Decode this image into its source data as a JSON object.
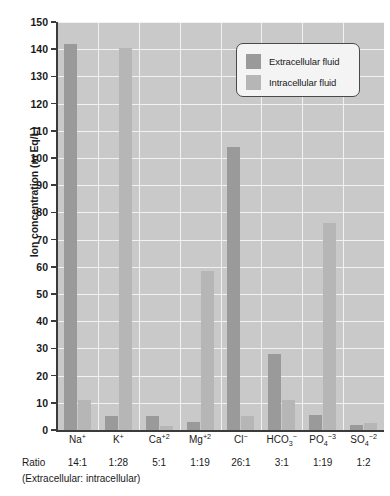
{
  "chart_data": {
    "type": "bar",
    "title": "",
    "subtitle": "",
    "xlabel": "",
    "ylabel": "Ion concentration (m Eq/L)",
    "ylim": [
      0,
      150
    ],
    "ytick_step": 10,
    "yticks": [
      0,
      10,
      20,
      30,
      40,
      50,
      60,
      70,
      80,
      90,
      100,
      110,
      120,
      130,
      140,
      150
    ],
    "grid": true,
    "grid_color": "#f2f2f2",
    "plot_background": "#c9c9c9",
    "legend_position": "upper-right",
    "categories": [
      "Na+",
      "K+",
      "Ca+2",
      "Mg+2",
      "Cl-",
      "HCO3-",
      "PO4-3",
      "SO4-2"
    ],
    "category_labels": [
      {
        "base": "Na",
        "sup": "+",
        "sub": ""
      },
      {
        "base": "K",
        "sup": "+",
        "sub": ""
      },
      {
        "base": "Ca",
        "sup": "+2",
        "sub": ""
      },
      {
        "base": "Mg",
        "sup": "+2",
        "sub": ""
      },
      {
        "base": "Cl",
        "sup": "−",
        "sub": ""
      },
      {
        "base": "HCO",
        "sup": "−",
        "sub": "3"
      },
      {
        "base": "PO",
        "sup": "−3",
        "sub": "4"
      },
      {
        "base": "SO",
        "sup": "−2",
        "sub": "4"
      }
    ],
    "series": [
      {
        "name": "Extracellular fluid",
        "color": "#9a9a9a",
        "values": [
          142,
          5,
          5,
          3,
          104,
          28,
          5.5,
          2
        ]
      },
      {
        "name": "Intracellular fluid",
        "color": "#b6b6b6",
        "values": [
          11,
          140.5,
          1.5,
          58.5,
          5,
          11,
          76,
          2.5
        ]
      }
    ],
    "annotations": {
      "ratio_row_title": "Ratio",
      "ratios": [
        "14:1",
        "1:28",
        "5:1",
        "1:19",
        "26:1",
        "3:1",
        "1:19",
        "1:2"
      ],
      "ratio_note": "(Extracellular: intracellular)"
    }
  },
  "legend": {
    "items": [
      {
        "label": "Extracellular fluid",
        "color": "#9a9a9a"
      },
      {
        "label": "Intracellular fluid",
        "color": "#b6b6b6"
      }
    ]
  }
}
